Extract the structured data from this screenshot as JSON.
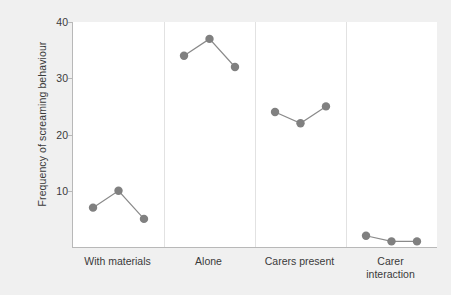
{
  "chart_data": {
    "type": "line",
    "title": "",
    "xlabel": "",
    "ylabel": "Frequency of screaming behaviour",
    "ylim": [
      0,
      40
    ],
    "yticks": [
      10,
      20,
      30,
      40
    ],
    "ytick_labels": [
      "10",
      "20",
      "30",
      "40"
    ],
    "grid": false,
    "legend": "none",
    "marker": "circle",
    "marker_color": "#808080",
    "line_color": "#8a8a8a",
    "panel_divider_color": "#e2e2e2",
    "axis_color": "#b8b8b8",
    "plot_background": "#ffffff",
    "figure_background": "#f0f0f0",
    "panels": [
      {
        "label": "With materials",
        "x": [
          1,
          2,
          3
        ],
        "values": [
          7,
          10,
          5
        ]
      },
      {
        "label": "Alone",
        "x": [
          1,
          2,
          3
        ],
        "values": [
          34,
          37,
          32
        ]
      },
      {
        "label": "Carers present",
        "x": [
          1,
          2,
          3
        ],
        "values": [
          24,
          22,
          25
        ]
      },
      {
        "label": "Carer\ninteraction",
        "x": [
          1,
          2,
          3
        ],
        "values": [
          2,
          1,
          1
        ]
      }
    ]
  }
}
